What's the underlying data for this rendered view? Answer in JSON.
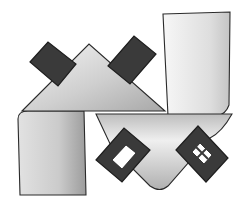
{
  "image": {
    "title": "Pencil sketch of folded shapes with dark diamond blocks",
    "width": 247,
    "height": 201,
    "colors": {
      "background": "#ffffff",
      "outline": "#2a2a2a",
      "dark_fill": "#3a3a3a",
      "mid_shade": "#9a9a9a",
      "light_shade": "#d8d8d8"
    }
  },
  "shapes": {
    "top_triangle": "M22,111 L89,44 L165,111 Z",
    "left_panel": "M18,119 Q18,111 28,111 L84,111 L86,195 L20,195 Z",
    "right_tall_panel": "M163,14 L230,12 L229,105 Q226,114 217,116 L168,116 Z",
    "bottom_funnel": "M96,114 L232,114 Q222,132 210,138 L168,186 Q160,193 150,186 L112,148 Z",
    "diamond_top_left": "M30,62 L48,42 L76,64 L58,86 Z",
    "diamond_top_right": "M108,66 L134,36 L156,54 L130,84 Z",
    "frame_bottom_left": "M96,160 L124,128 L150,150 L122,182 Z",
    "frame_bottom_left_hole": "M112,160 L126,145 L136,153 L122,169 Z",
    "frame_bottom_right": "M176,150 L198,126 L228,158 L206,182 Z",
    "frame_bottom_right_hole": "M192,152 L200,143 L212,155 L204,164 Z"
  }
}
